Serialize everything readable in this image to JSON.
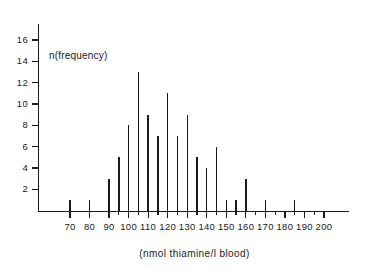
{
  "chart_data": {
    "type": "bar",
    "title": "",
    "subtitle": "",
    "xlabel": "(nmol thiamine/l blood)",
    "ylabel": "n(frequency)",
    "annotation": "n(frequency)",
    "xlim": [
      62,
      207
    ],
    "ylim": [
      0,
      17.5
    ],
    "grid": false,
    "legend": null,
    "x_major_ticks": [
      70,
      80,
      90,
      100,
      110,
      120,
      130,
      140,
      150,
      160,
      170,
      180,
      190,
      200
    ],
    "x_minor_ticks": [
      95,
      105,
      115,
      125,
      135,
      145,
      155,
      165,
      175,
      185,
      195
    ],
    "x_tick_labels": [
      "70",
      "80",
      "90",
      "100",
      "110",
      "120",
      "130",
      "140",
      "150",
      "160",
      "170",
      "180",
      "190",
      "200"
    ],
    "y_ticks": [
      2,
      4,
      6,
      8,
      10,
      12,
      14,
      16
    ],
    "y_tick_labels": [
      "2",
      "4",
      "6",
      "8",
      "10",
      "12",
      "14",
      "16"
    ],
    "categories": [
      70,
      80,
      90,
      95,
      100,
      105,
      110,
      115,
      120,
      125,
      130,
      135,
      140,
      145,
      150,
      155,
      160,
      170,
      185
    ],
    "values": [
      1,
      1,
      3,
      5,
      8,
      13,
      9,
      7,
      11,
      7,
      9,
      5,
      4,
      6,
      1,
      1,
      3,
      1,
      1
    ],
    "points": [
      {
        "x": 70,
        "y": 1
      },
      {
        "x": 80,
        "y": 1
      },
      {
        "x": 90,
        "y": 3
      },
      {
        "x": 95,
        "y": 5
      },
      {
        "x": 100,
        "y": 8
      },
      {
        "x": 105,
        "y": 13
      },
      {
        "x": 110,
        "y": 9
      },
      {
        "x": 115,
        "y": 7
      },
      {
        "x": 120,
        "y": 11
      },
      {
        "x": 125,
        "y": 7
      },
      {
        "x": 130,
        "y": 9
      },
      {
        "x": 135,
        "y": 5
      },
      {
        "x": 140,
        "y": 4
      },
      {
        "x": 145,
        "y": 6
      },
      {
        "x": 150,
        "y": 1
      },
      {
        "x": 155,
        "y": 1
      },
      {
        "x": 160,
        "y": 3
      },
      {
        "x": 170,
        "y": 1
      },
      {
        "x": 185,
        "y": 1
      }
    ],
    "colors": {
      "ink": "#1a1a1a",
      "background": "#ffffff"
    }
  }
}
